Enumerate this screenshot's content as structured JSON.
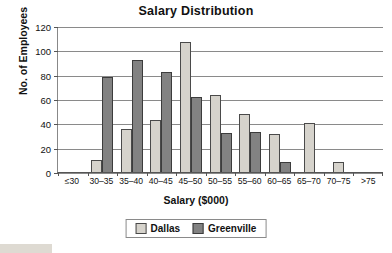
{
  "chart_data": {
    "type": "bar",
    "title": "Salary Distribution",
    "xlabel": "Salary ($000)",
    "ylabel": "No. of Employees",
    "categories": [
      "≤30",
      "30–35",
      "35–40",
      "40–45",
      "45–50",
      "50–55",
      "55–60",
      "60–65",
      "65–70",
      "70–75",
      ">75"
    ],
    "series": [
      {
        "name": "Dallas",
        "color": "#d6d3cc",
        "values": [
          0,
          10,
          35,
          43,
          107,
          63,
          48,
          31,
          40,
          8,
          0
        ]
      },
      {
        "name": "Greenville",
        "color": "#828282",
        "values": [
          0,
          78,
          92,
          82,
          62,
          32,
          33,
          8,
          0,
          0,
          0
        ]
      }
    ],
    "ylim": [
      0,
      120
    ],
    "yticks": [
      0,
      20,
      40,
      60,
      80,
      100,
      120
    ],
    "ytick_labels": [
      "0",
      "20",
      "40",
      "60",
      "80",
      "100",
      "120"
    ],
    "grid": true,
    "legend_position": "bottom"
  },
  "legend": {
    "items": [
      {
        "label": "Dallas"
      },
      {
        "label": "Greenville"
      }
    ]
  }
}
